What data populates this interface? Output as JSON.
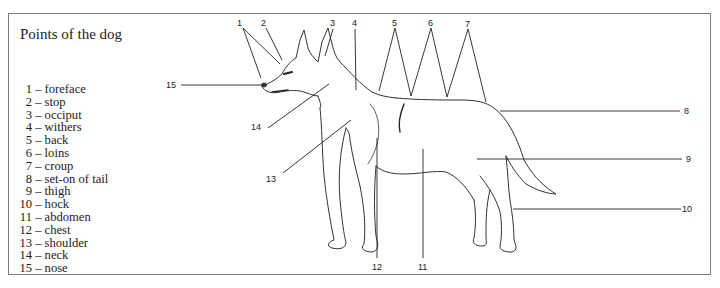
{
  "title": "Points of the dog",
  "legend": [
    {
      "num": "1",
      "sep": " – ",
      "label": "foreface"
    },
    {
      "num": "2",
      "sep": " – ",
      "label": "stop"
    },
    {
      "num": "3",
      "sep": " – ",
      "label": "occiput"
    },
    {
      "num": "4",
      "sep": " – ",
      "label": "withers"
    },
    {
      "num": "5",
      "sep": " – ",
      "label": "back"
    },
    {
      "num": "6",
      "sep": " – ",
      "label": "loins"
    },
    {
      "num": "7",
      "sep": " – ",
      "label": "croup"
    },
    {
      "num": "8",
      "sep": " – ",
      "label": "set-on of tail"
    },
    {
      "num": "9",
      "sep": " – ",
      "label": "thigh"
    },
    {
      "num": "10",
      "sep": " – ",
      "label": "hock"
    },
    {
      "num": "11",
      "sep": " – ",
      "label": "abdomen"
    },
    {
      "num": "12",
      "sep": " – ",
      "label": "chest"
    },
    {
      "num": "13",
      "sep": " – ",
      "label": "shoulder"
    },
    {
      "num": "14",
      "sep": " – ",
      "label": "neck"
    },
    {
      "num": "15",
      "sep": " – ",
      "label": "nose"
    }
  ],
  "callouts": {
    "c1": "1",
    "c2": "2",
    "c3": "3",
    "c4": "4",
    "c5": "5",
    "c6": "6",
    "c7": "7",
    "c8": "8",
    "c9": "9",
    "c10": "10",
    "c11": "11",
    "c12": "12",
    "c13": "13",
    "c14": "14",
    "c15": "15"
  },
  "colors": {
    "frame": "#7a7a7a",
    "ink": "#222222"
  }
}
